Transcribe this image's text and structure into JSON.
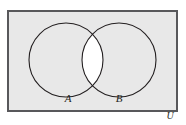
{
  "figure": {
    "kind": "venn-diagram",
    "caption_text": "",
    "sets": [
      {
        "id": "A",
        "label": "A",
        "cx": 66,
        "cy": 60,
        "r": 37
      },
      {
        "id": "B",
        "label": "B",
        "cx": 119,
        "cy": 60,
        "r": 37
      }
    ],
    "universe": {
      "label": "U",
      "x": 7,
      "y": 10,
      "width": 171,
      "height": 102
    },
    "labels": {
      "set_a": "A",
      "set_b": "B",
      "universe": "U"
    },
    "shading": {
      "description": "complement of A intersect B",
      "shaded_fill": "#e8e8e8",
      "unshaded_fill": "#ffffff",
      "outside_fill": "#ffffff"
    },
    "colors": {
      "border": "#58585b",
      "circle_stroke": "#231f20",
      "shaded_region": "#e8e8e8",
      "lens_region": "#ffffff",
      "text": "#231f20",
      "page_background": "#ffffff"
    }
  }
}
